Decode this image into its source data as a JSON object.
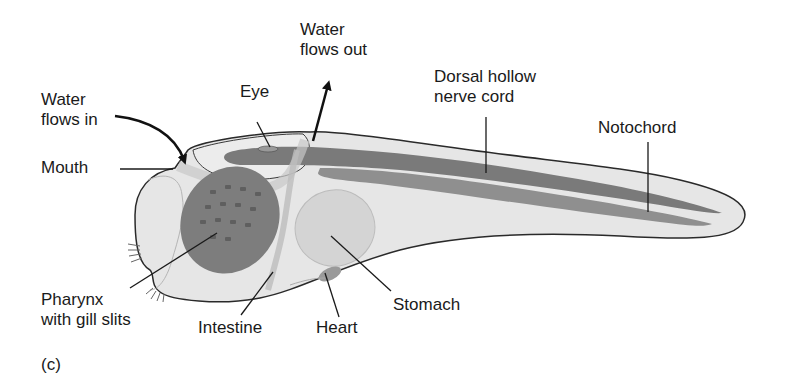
{
  "figure": {
    "panel_label": "(c)",
    "labels": {
      "water_in": "Water\nflows in",
      "water_out": "Water\nflows out",
      "eye": "Eye",
      "mouth": "Mouth",
      "dorsal_nerve_cord": "Dorsal hollow\nnerve cord",
      "notochord": "Notochord",
      "pharynx": "Pharynx\nwith gill slits",
      "intestine": "Intestine",
      "heart": "Heart",
      "stomach": "Stomach"
    },
    "colors": {
      "body_fill": "#e6e6e6",
      "outline": "#2a2a2a",
      "nerve_cord": "#7a7a7a",
      "notochord": "#8f8f8f",
      "pharynx": "#7d7d7d",
      "organ_fill": "#d4d4d4",
      "leader_line": "#1a1a1a"
    }
  }
}
